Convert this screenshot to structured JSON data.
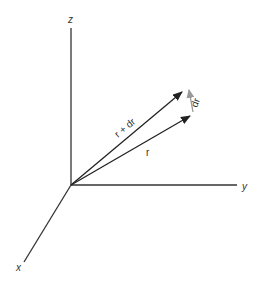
{
  "diagram": {
    "axes": {
      "z_label": "z",
      "y_label": "y",
      "x_label": "x"
    },
    "vectors": {
      "r_label": "r",
      "r_plus_dr_label": "r + dr",
      "dr_label": "dr"
    },
    "colors": {
      "axis": "#333333",
      "vector": "#222222",
      "dr_vector": "#999999",
      "background": "#ffffff"
    }
  }
}
